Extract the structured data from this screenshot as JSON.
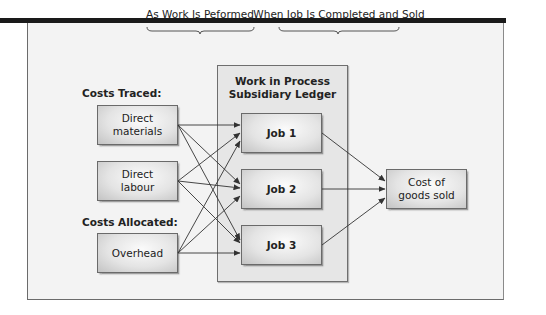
{
  "headers": {
    "performed": "As Work Is Peformed",
    "completed": "When Job Is Completed and Sold"
  },
  "labels": {
    "costs_traced": "Costs Traced:",
    "costs_allocated": "Costs Allocated:"
  },
  "sources": [
    {
      "id": "direct-materials",
      "line1": "Direct",
      "line2": "materials"
    },
    {
      "id": "direct-labour",
      "line1": "Direct",
      "line2": "labour"
    },
    {
      "id": "overhead",
      "line1": "Overhead",
      "line2": ""
    }
  ],
  "wip": {
    "title_line1": "Work in Process",
    "title_line2": "Subsidiary Ledger",
    "jobs": [
      {
        "label": "Job 1"
      },
      {
        "label": "Job 2"
      },
      {
        "label": "Job 3"
      }
    ]
  },
  "cogs": {
    "line1": "Cost of",
    "line2": "goods sold"
  },
  "colors": {
    "topbar": "#1a1a1a",
    "frame_bg": "#f3f3f3",
    "wip_bg": "#e6e6e6",
    "line": "#333333"
  }
}
